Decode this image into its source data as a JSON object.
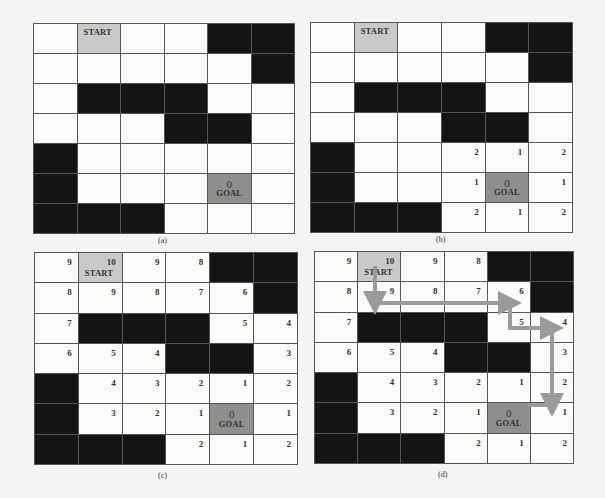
{
  "figure": {
    "panels": [
      {
        "id": "a",
        "caption": "(a)",
        "box": {
          "left": 33,
          "top": 23,
          "width": 262,
          "height": 211
        },
        "caption_pos": {
          "left": 158,
          "top": 236
        },
        "rows": [
          [
            "",
            "START",
            "",
            "",
            "#",
            "#"
          ],
          [
            "",
            "",
            "",
            "",
            "",
            "#"
          ],
          [
            "",
            "#",
            "#",
            "#",
            "",
            ""
          ],
          [
            "",
            "",
            "",
            "#",
            "#",
            ""
          ],
          [
            "#",
            "",
            "",
            "",
            "",
            ""
          ],
          [
            "#",
            "",
            "",
            "",
            "G",
            ""
          ],
          [
            "#",
            "#",
            "#",
            "",
            "",
            ""
          ]
        ],
        "numbers": [
          [
            null,
            null,
            null,
            null,
            null,
            null
          ],
          [
            null,
            null,
            null,
            null,
            null,
            null
          ],
          [
            null,
            null,
            null,
            null,
            null,
            null
          ],
          [
            null,
            null,
            null,
            null,
            null,
            null
          ],
          [
            null,
            null,
            null,
            null,
            null,
            null
          ],
          [
            null,
            null,
            null,
            null,
            "0",
            null
          ],
          [
            null,
            null,
            null,
            null,
            null,
            null
          ]
        ]
      },
      {
        "id": "b",
        "caption": "(b)",
        "box": {
          "left": 310,
          "top": 22,
          "width": 263,
          "height": 211
        },
        "caption_pos": {
          "left": 436,
          "top": 235
        },
        "rows": [
          [
            "",
            "START",
            "",
            "",
            "#",
            "#"
          ],
          [
            "",
            "",
            "",
            "",
            "",
            "#"
          ],
          [
            "",
            "#",
            "#",
            "#",
            "",
            ""
          ],
          [
            "",
            "",
            "",
            "#",
            "#",
            ""
          ],
          [
            "#",
            "",
            "",
            "",
            "",
            ""
          ],
          [
            "#",
            "",
            "",
            "",
            "G",
            ""
          ],
          [
            "#",
            "#",
            "#",
            "",
            "",
            ""
          ]
        ],
        "numbers": [
          [
            null,
            null,
            null,
            null,
            null,
            null
          ],
          [
            null,
            null,
            null,
            null,
            null,
            null
          ],
          [
            null,
            null,
            null,
            null,
            null,
            null
          ],
          [
            null,
            null,
            null,
            null,
            null,
            null
          ],
          [
            null,
            null,
            null,
            "2",
            "1",
            "2"
          ],
          [
            null,
            null,
            null,
            "1",
            "0",
            "1"
          ],
          [
            null,
            null,
            null,
            "2",
            "1",
            "2"
          ]
        ]
      },
      {
        "id": "c",
        "caption": "(c)",
        "box": {
          "left": 34,
          "top": 252,
          "width": 264,
          "height": 213
        },
        "caption_pos": {
          "left": 158,
          "top": 471
        },
        "rows": [
          [
            "",
            "START",
            "",
            "",
            "#",
            "#"
          ],
          [
            "",
            "",
            "",
            "",
            "",
            "#"
          ],
          [
            "",
            "#",
            "#",
            "#",
            "",
            ""
          ],
          [
            "",
            "",
            "",
            "#",
            "#",
            ""
          ],
          [
            "#",
            "",
            "",
            "",
            "",
            ""
          ],
          [
            "#",
            "",
            "",
            "",
            "G",
            ""
          ],
          [
            "#",
            "#",
            "#",
            "",
            "",
            ""
          ]
        ],
        "numbers": [
          [
            "9",
            "10",
            "9",
            "8",
            null,
            null
          ],
          [
            "8",
            "9",
            "8",
            "7",
            "6",
            null
          ],
          [
            "7",
            null,
            null,
            null,
            "5",
            "4"
          ],
          [
            "6",
            "5",
            "4",
            null,
            null,
            "3"
          ],
          [
            null,
            "4",
            "3",
            "2",
            "1",
            "2"
          ],
          [
            null,
            "3",
            "2",
            "1",
            "0",
            "1"
          ],
          [
            null,
            null,
            null,
            "2",
            "1",
            "2"
          ]
        ]
      },
      {
        "id": "d",
        "caption": "(d)",
        "box": {
          "left": 314,
          "top": 251,
          "width": 260,
          "height": 213
        },
        "caption_pos": {
          "left": 438,
          "top": 470
        },
        "rows": [
          [
            "",
            "START",
            "",
            "",
            "#",
            "#"
          ],
          [
            "",
            "",
            "",
            "",
            "",
            "#"
          ],
          [
            "",
            "#",
            "#",
            "#",
            "",
            ""
          ],
          [
            "",
            "",
            "",
            "#",
            "#",
            ""
          ],
          [
            "#",
            "",
            "",
            "",
            "",
            ""
          ],
          [
            "#",
            "",
            "",
            "",
            "G",
            ""
          ],
          [
            "#",
            "#",
            "#",
            "",
            "",
            ""
          ]
        ],
        "numbers": [
          [
            "9",
            "10",
            "9",
            "8",
            null,
            null
          ],
          [
            "8",
            "9",
            "8",
            "7",
            "6",
            null
          ],
          [
            "7",
            null,
            null,
            null,
            "5",
            "4"
          ],
          [
            "6",
            "5",
            "4",
            null,
            null,
            "3"
          ],
          [
            null,
            "4",
            "3",
            "2",
            "1",
            "2"
          ],
          [
            null,
            "3",
            "2",
            "1",
            "0",
            "1"
          ],
          [
            null,
            null,
            null,
            "2",
            "1",
            "2"
          ]
        ],
        "path": [
          [
            375,
            268
          ],
          [
            375,
            303
          ],
          [
            510,
            303
          ],
          [
            510,
            328
          ],
          [
            552,
            328
          ],
          [
            552,
            405
          ],
          [
            530,
            405
          ]
        ]
      }
    ],
    "labels": {
      "start": "START",
      "goal": "GOAL"
    },
    "colors": {
      "wall": "#141414",
      "start": "#c9c9c7",
      "goal": "#8e8e8c",
      "path": "#9a9a98",
      "grid": "#555555"
    }
  }
}
